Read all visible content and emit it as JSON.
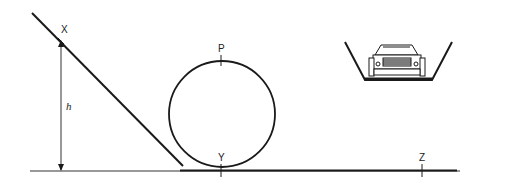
{
  "diagram": {
    "type": "loop-the-loop track",
    "labels": {
      "x_point": "X",
      "p_point": "P",
      "y_point": "Y",
      "z_point": "Z",
      "height": "h"
    },
    "colors": {
      "line": "#1a1a1a",
      "background": "#ffffff"
    },
    "inset": {
      "description": "front view of car in channel-shaped track"
    }
  }
}
